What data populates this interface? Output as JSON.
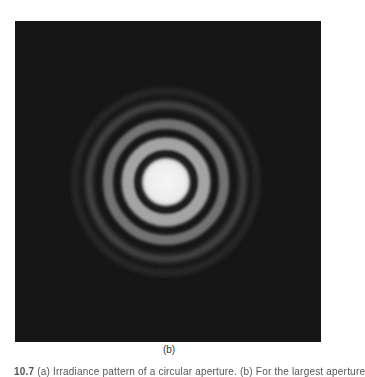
{
  "figure": {
    "panel_label": "(b)",
    "background_color": "#161616",
    "center_color": "#f2f2f2",
    "rings": [
      {
        "type": "bright",
        "radius": 0,
        "width": 48,
        "color": "#f0f0f0"
      },
      {
        "type": "dark",
        "radius": 28,
        "width": 5,
        "color": "#1a1a1a"
      },
      {
        "type": "bright",
        "radius": 37,
        "width": 12,
        "color": "#9a9a9a"
      },
      {
        "type": "dark",
        "radius": 48,
        "width": 6,
        "color": "#1c1c1c"
      },
      {
        "type": "bright",
        "radius": 58,
        "width": 9,
        "color": "#6a6a6a"
      },
      {
        "type": "dark",
        "radius": 68,
        "width": 6,
        "color": "#1a1a1a"
      },
      {
        "type": "bright",
        "radius": 77,
        "width": 7,
        "color": "#444444"
      },
      {
        "type": "bright",
        "radius": 91,
        "width": 6,
        "color": "#2c2c2c"
      }
    ]
  },
  "caption": {
    "figure_number": "10.7",
    "text": "(a) Irradiance pattern of a circular aperture. (b) For the largest aperture"
  }
}
